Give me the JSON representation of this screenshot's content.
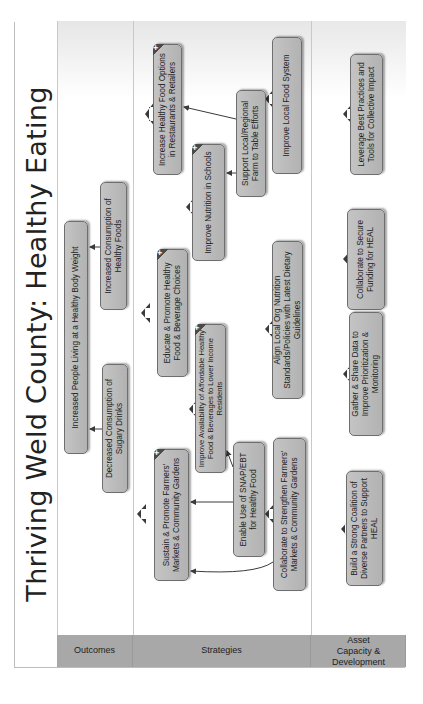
{
  "title": "Thriving Weld County: Healthy Eating",
  "rows": [
    {
      "id": "outcomes",
      "label": "Outcomes"
    },
    {
      "id": "strategies",
      "label": "Strategies"
    },
    {
      "id": "asset",
      "label": "Asset Capacity & Development"
    }
  ],
  "nodes": {
    "outcome_body_weight": {
      "label": "Increased People Living at a Healthy Body Weight",
      "expandable": false
    },
    "outcome_healthy_foods": {
      "label": "Increased Consumption of Healthy Foods",
      "expandable": false
    },
    "outcome_sugary_drinks": {
      "label": "Decreased Consumption of Sugary Drinks",
      "expandable": false
    },
    "strategy_restaurants": {
      "label": "Increase Healthy Food Options in Restaurants & Retailers",
      "expandable": true
    },
    "strategy_schools": {
      "label": "Improve Nutrition in Schools",
      "expandable": true
    },
    "strategy_educate": {
      "label": "Educate & Promote Healthy Food & Beverage Choices",
      "expandable": true
    },
    "strategy_availability": {
      "label": "Improve Availability of Affordable Healthy Food & Beverages to Lower Income Residents",
      "expandable": true
    },
    "strategy_farmers_markets": {
      "label": "Sustain & Promote Farmers' Markets & Community Gardens",
      "expandable": true
    },
    "strategy_farm_to_table": {
      "label": "Support Local/Regional Farm to Table Efforts",
      "expandable": false
    },
    "strategy_snap": {
      "label": "Enable Use of SNAP/EBT for Healthy Food",
      "expandable": false
    },
    "strategy_local_food_system": {
      "label": "Improve Local Food System",
      "expandable": false
    },
    "strategy_dietary_guidelines": {
      "label": "Align Local Org Nutrition Standards/Policies with Latest Dietary Guidelines",
      "expandable": false
    },
    "strategy_strengthen_markets": {
      "label": "Collaborate to Strengthen Farmers' Markets & Community Gardens",
      "expandable": false
    },
    "asset_best_practices": {
      "label": "Leverage Best Practices and Tools for Collective Impact",
      "expandable": false
    },
    "asset_funding": {
      "label": "Collaborate to Secure Funding for HEAL",
      "expandable": false
    },
    "asset_data": {
      "label": "Gather & Share Data to Improve Prioritization & Monitoring",
      "expandable": false
    },
    "asset_coalition": {
      "label": "Build a Strong Coalition of Diverse Partners to Support HEAL",
      "expandable": false
    }
  },
  "expand_symbol": "+",
  "colors": {
    "node_fill": "#b8b8b8",
    "node_border": "#6e6e6e",
    "row_label_fill": "#a8a8a8",
    "arrow": "#3a3a3a"
  }
}
